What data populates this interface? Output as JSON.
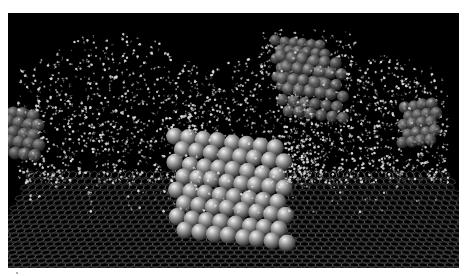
{
  "figure": {
    "background": "#ffffff",
    "panel_background": "#000000"
  },
  "scene": {
    "graphene": {
      "color": "#9a9a9a",
      "near_left": [
        0,
        205
      ],
      "near_right": [
        451,
        205
      ],
      "far_left": [
        20,
        158
      ],
      "far_right": [
        440,
        158
      ],
      "front_left": [
        60,
        255
      ],
      "front_right": [
        400,
        255
      ],
      "rows": 22,
      "cols": 60
    },
    "water": {
      "color": "#d8d8d8",
      "count": 2600,
      "regions": [
        {
          "x0": 10,
          "x1": 190,
          "y0": 20,
          "y1": 170,
          "weight": 0.34,
          "top_curve": 30
        },
        {
          "x0": 180,
          "x1": 300,
          "y0": 45,
          "y1": 175,
          "weight": 0.22,
          "top_curve": 20
        },
        {
          "x0": 280,
          "x1": 440,
          "y0": 40,
          "y1": 170,
          "weight": 0.34,
          "top_curve": 25
        },
        {
          "x0": 250,
          "x1": 350,
          "y0": 15,
          "y1": 60,
          "weight": 0.05,
          "top_curve": 0
        },
        {
          "x0": 20,
          "x1": 440,
          "y0": 150,
          "y1": 200,
          "weight": 0.05,
          "top_curve": 0
        }
      ]
    },
    "clusters": [
      {
        "name": "central-nanoparticle",
        "cx": 217,
        "cy": 170,
        "cols": 8,
        "rows": 8,
        "r": 8.5,
        "dx": 14.5,
        "dy": 13.5,
        "skew": 3.5,
        "shade": "#c8c8c8"
      },
      {
        "name": "upper-cluster",
        "cx": 290,
        "cy": 50,
        "cols": 6,
        "rows": 6,
        "r": 5.5,
        "dx": 9,
        "dy": 9,
        "skew": 2,
        "shade": "#8a8a8a"
      },
      {
        "name": "left-cluster",
        "cx": 10,
        "cy": 118,
        "cols": 4,
        "rows": 5,
        "r": 6.5,
        "dx": 10,
        "dy": 10,
        "skew": 3,
        "shade": "#7a7a7a"
      },
      {
        "name": "right-cluster",
        "cx": 410,
        "cy": 112,
        "cols": 4,
        "rows": 5,
        "r": 6,
        "dx": 9,
        "dy": 9,
        "skew": -2.5,
        "shade": "#8a8a8a"
      },
      {
        "name": "center-haze",
        "cx": 300,
        "cy": 70,
        "cols": 6,
        "rows": 6,
        "r": 6,
        "dx": 11,
        "dy": 11,
        "skew": 3,
        "shade": "#606060"
      }
    ],
    "seed": 1337
  }
}
